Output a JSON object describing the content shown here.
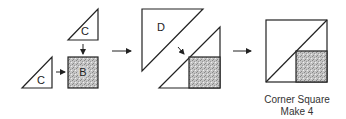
{
  "diagram": {
    "step1": {
      "top_triangle_label": "C",
      "left_triangle_label": "C",
      "square_label": "B"
    },
    "step2": {
      "triangle_label": "D"
    },
    "result": {
      "caption_line1": "Corner Square",
      "caption_line2": "Make 4"
    },
    "colors": {
      "stroke": "#222222",
      "shade": "#b8b8b8"
    }
  }
}
